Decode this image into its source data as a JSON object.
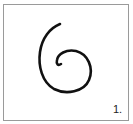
{
  "figure": {
    "label": "1.",
    "shape": "spiral-icon",
    "stroke_color": "#111111",
    "border_color": "#9a9a9a",
    "background": "#ffffff"
  }
}
